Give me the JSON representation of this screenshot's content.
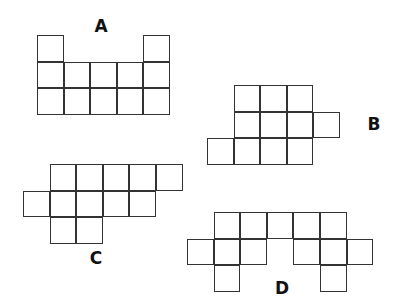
{
  "cell_size": 26.6,
  "line_color": "#333333",
  "shapes": [
    {
      "label": "A",
      "origin": [
        37,
        35
      ],
      "label_pos": [
        101,
        26
      ],
      "cells": [
        [
          0,
          0
        ],
        [
          4,
          0
        ],
        [
          0,
          1
        ],
        [
          1,
          1
        ],
        [
          2,
          1
        ],
        [
          3,
          1
        ],
        [
          4,
          1
        ],
        [
          0,
          2
        ],
        [
          1,
          2
        ],
        [
          2,
          2
        ],
        [
          3,
          2
        ],
        [
          4,
          2
        ]
      ]
    },
    {
      "label": "B",
      "origin": [
        207,
        85
      ],
      "label_pos": [
        374,
        124
      ],
      "cells": [
        [
          1,
          0
        ],
        [
          2,
          0
        ],
        [
          3,
          0
        ],
        [
          1,
          1
        ],
        [
          2,
          1
        ],
        [
          3,
          1
        ],
        [
          4,
          1
        ],
        [
          0,
          2
        ],
        [
          1,
          2
        ],
        [
          2,
          2
        ],
        [
          3,
          2
        ]
      ]
    },
    {
      "label": "C",
      "origin": [
        23,
        164
      ],
      "label_pos": [
        96,
        258
      ],
      "cells": [
        [
          1,
          0
        ],
        [
          2,
          0
        ],
        [
          3,
          0
        ],
        [
          4,
          0
        ],
        [
          5,
          0
        ],
        [
          0,
          1
        ],
        [
          1,
          1
        ],
        [
          2,
          1
        ],
        [
          3,
          1
        ],
        [
          4,
          1
        ],
        [
          1,
          2
        ],
        [
          2,
          2
        ]
      ]
    },
    {
      "label": "D",
      "origin": [
        187,
        212
      ],
      "label_pos": [
        282,
        288
      ],
      "cells": [
        [
          1,
          0
        ],
        [
          2,
          0
        ],
        [
          3,
          0
        ],
        [
          4,
          0
        ],
        [
          5,
          0
        ],
        [
          0,
          1
        ],
        [
          1,
          1
        ],
        [
          2,
          1
        ],
        [
          4,
          1
        ],
        [
          5,
          1
        ],
        [
          6,
          1
        ],
        [
          1,
          2
        ],
        [
          5,
          2
        ]
      ]
    }
  ]
}
